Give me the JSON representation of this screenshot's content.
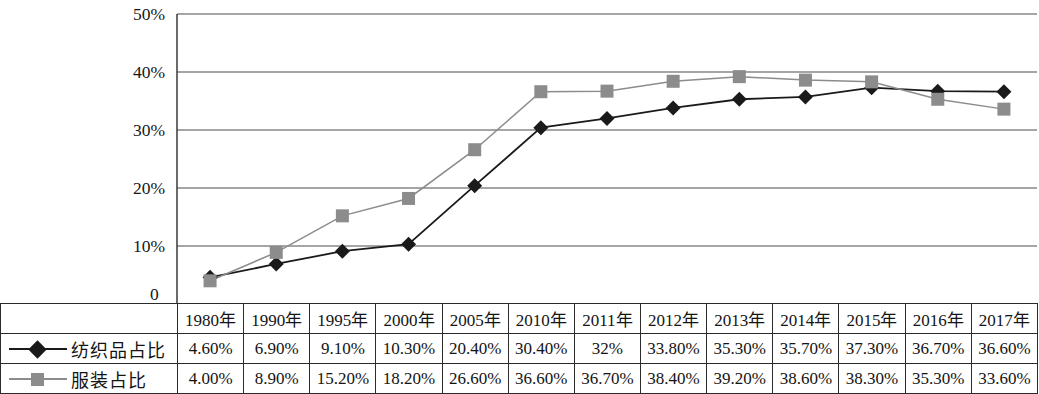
{
  "chart_data": {
    "type": "line",
    "title": "",
    "xlabel": "",
    "ylabel": "",
    "ylim": [
      0,
      50
    ],
    "y_unit": "%",
    "grid": true,
    "legend_position": "table-left",
    "categories": [
      "1980年",
      "1990年",
      "1995年",
      "2000年",
      "2005年",
      "2010年",
      "2011年",
      "2012年",
      "2013年",
      "2014年",
      "2015年",
      "2016年",
      "2017年"
    ],
    "x": [
      1980,
      1990,
      1995,
      2000,
      2005,
      2010,
      2011,
      2012,
      2013,
      2014,
      2015,
      2016,
      2017
    ],
    "y_ticks": [
      0,
      10,
      20,
      30,
      40,
      50
    ],
    "y_tick_labels": [
      "0",
      "10%",
      "20%",
      "30%",
      "40%",
      "50%"
    ],
    "series": [
      {
        "name": "纺织品占比",
        "marker": "diamond",
        "color": "#1a1a1a",
        "values": [
          4.6,
          6.9,
          9.1,
          10.3,
          20.4,
          30.4,
          32.0,
          33.8,
          35.3,
          35.7,
          37.3,
          36.7,
          36.6
        ],
        "labels": [
          "4.60%",
          "6.90%",
          "9.10%",
          "10.30%",
          "20.40%",
          "30.40%",
          "32%",
          "33.80%",
          "35.30%",
          "35.70%",
          "37.30%",
          "36.70%",
          "36.60%"
        ]
      },
      {
        "name": "服装占比",
        "marker": "square",
        "color": "#8c8c8c",
        "values": [
          4.0,
          8.9,
          15.2,
          18.2,
          26.6,
          36.6,
          36.7,
          38.4,
          39.2,
          38.6,
          38.3,
          35.3,
          33.6
        ],
        "labels": [
          "4.00%",
          "8.90%",
          "15.20%",
          "18.20%",
          "26.60%",
          "36.60%",
          "36.70%",
          "38.40%",
          "39.20%",
          "38.60%",
          "38.30%",
          "35.30%",
          "33.60%"
        ]
      }
    ]
  },
  "table": {
    "corner_label": "",
    "header": [
      "1980年",
      "1990年",
      "1995年",
      "2000年",
      "2005年",
      "2010年",
      "2011年",
      "2012年",
      "2013年",
      "2014年",
      "2015年",
      "2016年",
      "2017年"
    ],
    "rows": [
      {
        "label": "纺织品占比",
        "marker": "diamond",
        "color": "#1a1a1a",
        "cells": [
          "4.60%",
          "6.90%",
          "9.10%",
          "10.30%",
          "20.40%",
          "30.40%",
          "32%",
          "33.80%",
          "35.30%",
          "35.70%",
          "37.30%",
          "36.70%",
          "36.60%"
        ]
      },
      {
        "label": "服装占比",
        "marker": "square",
        "color": "#8c8c8c",
        "cells": [
          "4.00%",
          "8.90%",
          "15.20%",
          "18.20%",
          "26.60%",
          "36.60%",
          "36.70%",
          "38.40%",
          "39.20%",
          "38.60%",
          "38.30%",
          "35.30%",
          "33.60%"
        ]
      }
    ]
  },
  "axis": {
    "zero_label": "0",
    "tick_50": "50%",
    "tick_40": "40%",
    "tick_30": "30%",
    "tick_20": "20%",
    "tick_10": "10%"
  },
  "colors": {
    "textile_line": "#1a1a1a",
    "apparel_line": "#8c8c8c",
    "grid": "#4d4d4d",
    "axis": "#2b2b2b",
    "background": "#ffffff"
  }
}
